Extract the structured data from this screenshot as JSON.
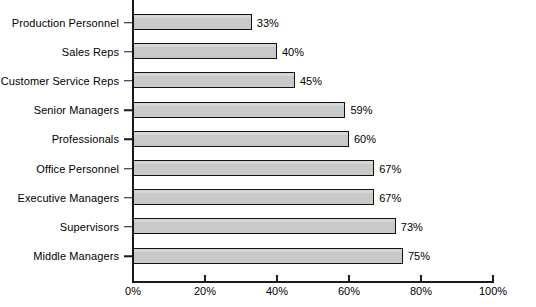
{
  "chart_data": {
    "type": "bar",
    "orientation": "horizontal",
    "title": "",
    "subtitle": "",
    "xlabel": "",
    "ylabel": "",
    "xlim": [
      0,
      100
    ],
    "grid": false,
    "legend": false,
    "value_suffix": "%",
    "categories": [
      "Production Personnel",
      "Sales Reps",
      "Customer Service Reps",
      "Senior Managers",
      "Professionals",
      "Office Personnel",
      "Executive Managers",
      "Supervisors",
      "Middle Managers"
    ],
    "values": [
      33,
      40,
      45,
      59,
      60,
      67,
      67,
      73,
      75
    ],
    "data_labels": [
      "33%",
      "40%",
      "45%",
      "59%",
      "60%",
      "67%",
      "67%",
      "73%",
      "75%"
    ],
    "xticks": [
      0,
      20,
      40,
      60,
      80,
      100
    ],
    "xtick_labels": [
      "0%",
      "20%",
      "40%",
      "60%",
      "80%",
      "100%"
    ],
    "colors": {
      "bar_fill": "#c9c9c9",
      "bar_border": "#111111",
      "axis": "#1a1a1a",
      "text": "#000000",
      "background": "#ffffff"
    }
  }
}
